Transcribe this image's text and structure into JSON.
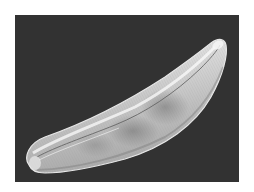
{
  "image": {
    "subject": "diatom",
    "description": "Scanning electron micrograph of a crescent-shaped diatom frustule on a dark background",
    "colors": {
      "page_background": "#ffffff",
      "micrograph_background": "#323232",
      "frustule_highlight": "#f2f2f2",
      "frustule_body": "#c8c8c8",
      "frustule_shadow": "#8a8a8a"
    }
  }
}
